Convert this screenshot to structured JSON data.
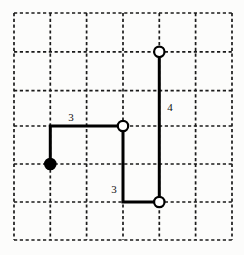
{
  "figure": {
    "background_color": "#fcfcfb",
    "grid": {
      "line_color": "#1a1a1a",
      "style": "dashed",
      "columns": 6,
      "rows": 6,
      "x_positions": [
        14,
        50.3,
        86.6,
        123,
        159.3,
        195.6,
        232
      ],
      "y_positions": [
        13,
        51.8,
        90.6,
        126,
        164,
        202,
        240
      ]
    },
    "path": {
      "stroke_color": "#000000",
      "stroke_width": 3,
      "points": [
        {
          "x": 50.3,
          "y": 164
        },
        {
          "x": 50.3,
          "y": 126
        },
        {
          "x": 123,
          "y": 126
        },
        {
          "x": 123,
          "y": 202
        },
        {
          "x": 159.3,
          "y": 202
        },
        {
          "x": 159.3,
          "y": 51.8
        }
      ]
    },
    "nodes": [
      {
        "name": "start-node-filled",
        "x": 50.3,
        "y": 164,
        "fill": "#000000",
        "stroke": "#000000",
        "radius": 5.2,
        "type": "filled"
      },
      {
        "name": "node-middle-open",
        "x": 123,
        "y": 126,
        "fill": "#ffffff",
        "stroke": "#000000",
        "radius": 5.2,
        "type": "open"
      },
      {
        "name": "node-bottom-open",
        "x": 159.3,
        "y": 202,
        "fill": "#ffffff",
        "stroke": "#000000",
        "radius": 5.2,
        "type": "open"
      },
      {
        "name": "node-top-open",
        "x": 159.3,
        "y": 51.8,
        "fill": "#ffffff",
        "stroke": "#000000",
        "radius": 5.2,
        "type": "open"
      }
    ],
    "labels": [
      {
        "name": "label-top-segment",
        "text": "3",
        "x": 71,
        "y": 121,
        "anchor": "middle"
      },
      {
        "name": "label-right-segment",
        "text": "4",
        "x": 170,
        "y": 111,
        "anchor": "middle"
      },
      {
        "name": "label-lower-segment",
        "text": "3",
        "x": 114,
        "y": 193,
        "anchor": "middle"
      }
    ]
  }
}
